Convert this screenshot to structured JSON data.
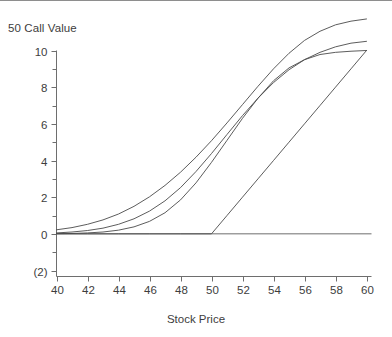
{
  "chart_data": {
    "type": "line",
    "title": "50 Call Value",
    "xlabel": "Stock Price",
    "ylabel": "",
    "xlim": [
      40,
      60
    ],
    "ylim": [
      -2,
      10
    ],
    "xticks": [
      40,
      42,
      44,
      46,
      48,
      50,
      52,
      54,
      56,
      58,
      60
    ],
    "xtick_labels": [
      "40",
      "42",
      "44",
      "46",
      "48",
      "50",
      "52",
      "54",
      "56",
      "58",
      "60"
    ],
    "yticks": [
      -2,
      0,
      2,
      4,
      6,
      8,
      10
    ],
    "ytick_labels": [
      "(2)",
      "0",
      "2",
      "4",
      "6",
      "8",
      "10"
    ],
    "y_minor_ticks": [
      -1,
      1,
      3,
      5,
      7,
      9
    ],
    "grid": false,
    "legend": null,
    "axis_color": "#6e6e6e",
    "line_color": "#4a4a4a",
    "background": "#ffffff",
    "strike": 50,
    "x": [
      40,
      41,
      42,
      43,
      44,
      45,
      46,
      47,
      48,
      49,
      50,
      51,
      52,
      53,
      54,
      55,
      56,
      57,
      58,
      59,
      60
    ],
    "series": [
      {
        "name": "longest-maturity-call",
        "values": [
          0.22,
          0.34,
          0.52,
          0.76,
          1.08,
          1.5,
          2.02,
          2.64,
          3.36,
          4.18,
          5.08,
          6.05,
          7.05,
          8.05,
          9.0,
          9.85,
          10.55,
          11.05,
          11.4,
          11.6,
          11.72
        ]
      },
      {
        "name": "medium-maturity-call",
        "values": [
          0.05,
          0.1,
          0.18,
          0.31,
          0.52,
          0.82,
          1.24,
          1.8,
          2.52,
          3.4,
          4.38,
          5.42,
          6.45,
          7.4,
          8.25,
          8.95,
          9.5,
          9.9,
          10.2,
          10.4,
          10.5
        ]
      },
      {
        "name": "short-maturity-call",
        "values": [
          0.01,
          0.02,
          0.05,
          0.1,
          0.2,
          0.38,
          0.68,
          1.15,
          1.85,
          2.78,
          3.9,
          5.1,
          6.3,
          7.4,
          8.35,
          9.05,
          9.5,
          9.78,
          9.9,
          9.96,
          10.0
        ]
      },
      {
        "name": "intrinsic-value",
        "values": [
          0,
          0,
          0,
          0,
          0,
          0,
          0,
          0,
          0,
          0,
          0,
          1,
          2,
          3,
          4,
          5,
          6,
          7,
          8,
          9,
          10
        ]
      }
    ]
  }
}
